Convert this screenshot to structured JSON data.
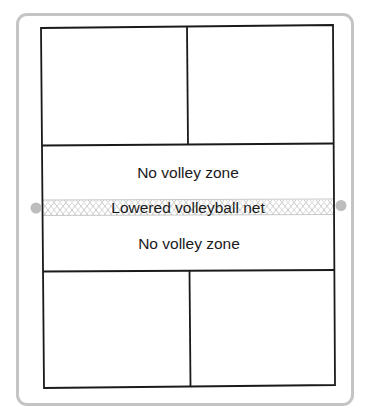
{
  "diagram": {
    "zones": {
      "upper_no_volley": "No volley zone",
      "net": "Lowered volleyball net",
      "lower_no_volley": "No volley zone"
    },
    "colors": {
      "frame": "#c4c4c4",
      "court_lines": "#1a1a1a",
      "net_pattern": "#c8c8c8",
      "net_posts": "#bdbdbd",
      "background": "#ffffff"
    },
    "court_regions": [
      "upper-left-service-box",
      "upper-right-service-box",
      "upper-no-volley-zone",
      "net",
      "lower-no-volley-zone",
      "lower-left-service-box",
      "lower-right-service-box"
    ]
  }
}
